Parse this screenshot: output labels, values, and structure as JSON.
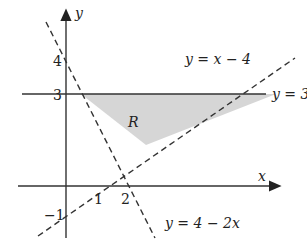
{
  "diagram": {
    "axes": {
      "x_label": "x",
      "y_label": "y"
    },
    "ticks": {
      "x": [
        "1",
        "2"
      ],
      "y": [
        "4",
        "3",
        "−1"
      ]
    },
    "lines": [
      {
        "id": "line-y-eq-3",
        "label": "y = 3",
        "style": "solid"
      },
      {
        "id": "line-y-eq-x-minus-4",
        "label": "y = x − 4",
        "style": "dashed"
      },
      {
        "id": "line-y-eq-4-minus-2x",
        "label": "y = 4 − 2x",
        "style": "dashed"
      }
    ],
    "region": {
      "label": "R",
      "fill": "#d6d6d6"
    },
    "header_fragment": "y ... {( ... ) ... }"
  }
}
